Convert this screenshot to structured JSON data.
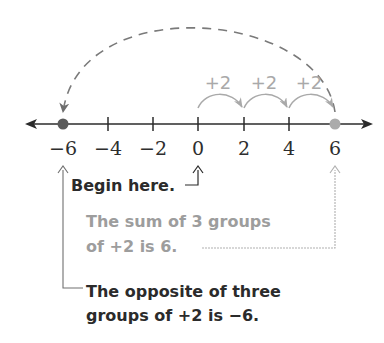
{
  "number_line": {
    "min": -6,
    "max": 6,
    "step": 2,
    "ticks": [
      {
        "value": -6,
        "label": "−6",
        "x": 63
      },
      {
        "value": -4,
        "label": "−4",
        "x": 108
      },
      {
        "value": -2,
        "label": "−2",
        "x": 153
      },
      {
        "value": 0,
        "label": "0",
        "x": 198
      },
      {
        "value": 2,
        "label": "2",
        "x": 244
      },
      {
        "value": 4,
        "label": "4",
        "x": 289
      },
      {
        "value": 6,
        "label": "6",
        "x": 335
      }
    ],
    "points": [
      {
        "value": -6,
        "color": "#5a5a5a"
      },
      {
        "value": 6,
        "color": "#ababab"
      }
    ]
  },
  "hops": [
    {
      "label": "+2",
      "from": 0,
      "to": 2
    },
    {
      "label": "+2",
      "from": 2,
      "to": 4
    },
    {
      "label": "+2",
      "from": 4,
      "to": 6
    }
  ],
  "opposite_arc": {
    "from": 6,
    "to": -6,
    "style": "dashed"
  },
  "annotations": {
    "begin": "Begin here.",
    "sum_line1": "The sum of 3 groups",
    "sum_line2": "of +2 is 6.",
    "opposite_line1": "The opposite of three",
    "opposite_line2": "groups of +2 is −6."
  },
  "colors": {
    "dark": "#2b2b2b",
    "gray": "#a0a0a0",
    "dashed": "#7a7a7a"
  }
}
